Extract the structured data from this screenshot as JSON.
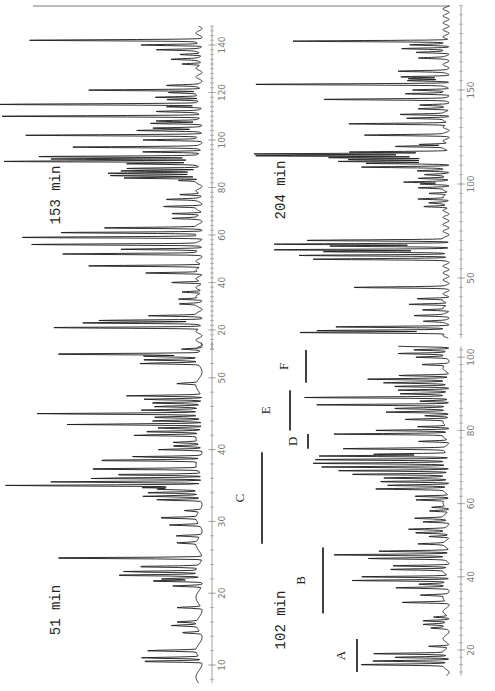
{
  "figure": {
    "orientation": "rotated-90-ccw",
    "top_rule": true
  },
  "chart_data": [
    {
      "type": "line",
      "title": "153 min",
      "xlabel": "",
      "ylabel": "",
      "xticks": [
        20,
        40,
        60,
        80,
        100,
        120,
        140
      ],
      "xlim": [
        12,
        148
      ],
      "layout": {
        "baseline_x": 203,
        "axis_x": 212,
        "label_x": 225,
        "y_at_min": 330,
        "min": 20,
        "px_per_unit": 2.375,
        "title_x": 60,
        "title_y": 195
      },
      "peaks": [
        [
          21,
          150
        ],
        [
          23,
          115
        ],
        [
          24,
          100
        ],
        [
          26,
          50
        ],
        [
          31,
          18
        ],
        [
          33,
          22
        ],
        [
          36,
          20
        ],
        [
          40,
          30
        ],
        [
          44,
          55
        ],
        [
          47,
          115
        ],
        [
          52,
          135
        ],
        [
          54,
          80
        ],
        [
          56,
          165
        ],
        [
          59,
          180
        ],
        [
          61,
          140
        ],
        [
          63,
          95
        ],
        [
          67,
          25
        ],
        [
          69,
          30
        ],
        [
          72,
          35
        ],
        [
          75,
          30
        ],
        [
          77,
          22
        ],
        [
          83,
          20
        ],
        [
          84,
          78
        ],
        [
          85,
          90
        ],
        [
          86,
          88
        ],
        [
          87,
          80
        ],
        [
          88,
          75
        ],
        [
          90,
          70
        ],
        [
          91,
          200
        ],
        [
          92,
          150
        ],
        [
          93,
          160
        ],
        [
          95,
          60
        ],
        [
          97,
          125
        ],
        [
          100,
          55
        ],
        [
          102,
          175
        ],
        [
          104,
          60
        ],
        [
          105,
          45
        ],
        [
          107,
          50
        ],
        [
          108,
          40
        ],
        [
          110,
          200
        ],
        [
          112,
          40
        ],
        [
          114,
          35
        ],
        [
          115,
          200
        ],
        [
          117,
          35
        ],
        [
          118,
          45
        ],
        [
          120,
          30
        ],
        [
          121,
          115
        ],
        [
          123,
          30
        ],
        [
          132,
          20
        ],
        [
          134,
          25
        ],
        [
          136,
          22
        ],
        [
          138,
          40
        ],
        [
          140,
          60
        ],
        [
          142,
          168
        ]
      ]
    },
    {
      "type": "line",
      "title": "204 min",
      "xticks": [
        50,
        100,
        150
      ],
      "xlim": [
        18,
        195
      ],
      "layout": {
        "baseline_x": 450,
        "axis_x": 461,
        "label_x": 474,
        "y_at_min": 278,
        "min": 50,
        "px_per_unit": 1.88,
        "title_x": 285,
        "title_y": 190
      },
      "peaks": [
        [
          21,
          150
        ],
        [
          22,
          130
        ],
        [
          24,
          110
        ],
        [
          27,
          20
        ],
        [
          30,
          30
        ],
        [
          33,
          25
        ],
        [
          36,
          40
        ],
        [
          39,
          30
        ],
        [
          45,
          90
        ],
        [
          60,
          130
        ],
        [
          62,
          150
        ],
        [
          64,
          120
        ],
        [
          65,
          175
        ],
        [
          67,
          115
        ],
        [
          68,
          170
        ],
        [
          70,
          140
        ],
        [
          88,
          25
        ],
        [
          90,
          15
        ],
        [
          92,
          30
        ],
        [
          95,
          20
        ],
        [
          98,
          28
        ],
        [
          100,
          25
        ],
        [
          101,
          40
        ],
        [
          103,
          30
        ],
        [
          105,
          20
        ],
        [
          107,
          30
        ],
        [
          109,
          85
        ],
        [
          111,
          80
        ],
        [
          112,
          105
        ],
        [
          113,
          100
        ],
        [
          114,
          120
        ],
        [
          115,
          190
        ],
        [
          116,
          190
        ],
        [
          117,
          100
        ],
        [
          120,
          50
        ],
        [
          121,
          30
        ],
        [
          126,
          80
        ],
        [
          132,
          100
        ],
        [
          135,
          40
        ],
        [
          137,
          45
        ],
        [
          140,
          30
        ],
        [
          142,
          25
        ],
        [
          145,
          120
        ],
        [
          148,
          40
        ],
        [
          150,
          35
        ],
        [
          153,
          190
        ],
        [
          155,
          40
        ],
        [
          156,
          35
        ],
        [
          157,
          45
        ],
        [
          160,
          45
        ],
        [
          167,
          25
        ],
        [
          170,
          30
        ],
        [
          172,
          45
        ],
        [
          174,
          35
        ],
        [
          176,
          155
        ]
      ]
    },
    {
      "type": "line",
      "title": "51 min",
      "xticks": [
        10,
        20,
        30,
        40,
        50
      ],
      "xlim": [
        7.5,
        55
      ],
      "layout": {
        "baseline_x": 203,
        "axis_x": 212,
        "label_x": 225,
        "y_at_min": 665,
        "min": 10,
        "px_per_unit": 7.18,
        "title_x": 60,
        "title_y": 610
      },
      "peaks": [
        [
          10.5,
          65
        ],
        [
          11,
          60
        ],
        [
          12,
          50
        ],
        [
          14.5,
          20
        ],
        [
          15.5,
          25
        ],
        [
          16,
          20
        ],
        [
          18,
          25
        ],
        [
          21,
          30
        ],
        [
          21.7,
          55
        ],
        [
          22,
          40
        ],
        [
          22.5,
          90
        ],
        [
          23,
          75
        ],
        [
          23.7,
          65
        ],
        [
          24.9,
          165
        ],
        [
          27,
          20
        ],
        [
          28,
          25
        ],
        [
          29.5,
          30
        ],
        [
          30.5,
          40
        ],
        [
          31.5,
          15
        ],
        [
          33,
          45
        ],
        [
          33.5,
          55
        ],
        [
          34,
          50
        ],
        [
          34.5,
          45
        ],
        [
          34.7,
          55
        ],
        [
          35,
          200
        ],
        [
          35.5,
          150
        ],
        [
          36,
          115
        ],
        [
          36.5,
          95
        ],
        [
          37.3,
          120
        ],
        [
          38.5,
          110
        ],
        [
          39,
          70
        ],
        [
          40,
          45
        ],
        [
          40.5,
          30
        ],
        [
          41,
          25
        ],
        [
          42,
          65
        ],
        [
          42.5,
          60
        ],
        [
          43,
          45
        ],
        [
          43.5,
          135
        ],
        [
          44,
          50
        ],
        [
          44.5,
          50
        ],
        [
          45,
          165
        ],
        [
          45.5,
          55
        ],
        [
          46,
          45
        ],
        [
          46.5,
          55
        ],
        [
          47,
          60
        ],
        [
          47.5,
          75
        ],
        [
          49.2,
          20
        ],
        [
          52,
          60
        ],
        [
          52.5,
          60
        ],
        [
          53,
          55
        ],
        [
          53.3,
          160
        ],
        [
          54,
          20
        ]
      ]
    },
    {
      "type": "line",
      "title": "102 min",
      "xticks": [
        20,
        40,
        60,
        80,
        100
      ],
      "xlim": [
        13,
        103
      ],
      "layout": {
        "baseline_x": 450,
        "axis_x": 461,
        "label_x": 474,
        "y_at_min": 650,
        "min": 20,
        "px_per_unit": 3.66,
        "title_x": 285,
        "title_y": 620
      },
      "peaks": [
        [
          16,
          85
        ],
        [
          17,
          75
        ],
        [
          18,
          55
        ],
        [
          19,
          70
        ],
        [
          21,
          20
        ],
        [
          26,
          15
        ],
        [
          27,
          20
        ],
        [
          28,
          25
        ],
        [
          29,
          15
        ],
        [
          33,
          45
        ],
        [
          35,
          25
        ],
        [
          37,
          50
        ],
        [
          38,
          25
        ],
        [
          39,
          95
        ],
        [
          40,
          90
        ],
        [
          42,
          55
        ],
        [
          43,
          55
        ],
        [
          45,
          75
        ],
        [
          46,
          115
        ],
        [
          47,
          70
        ],
        [
          49,
          25
        ],
        [
          51,
          20
        ],
        [
          52,
          30
        ],
        [
          53,
          35
        ],
        [
          55,
          25
        ],
        [
          56,
          30
        ],
        [
          58,
          20
        ],
        [
          59,
          15
        ],
        [
          61,
          30
        ],
        [
          62,
          35
        ],
        [
          64,
          70
        ],
        [
          65,
          60
        ],
        [
          66,
          70
        ],
        [
          67,
          60
        ],
        [
          68,
          95
        ],
        [
          69,
          110
        ],
        [
          70,
          130
        ],
        [
          71,
          130
        ],
        [
          72,
          135
        ],
        [
          73,
          130
        ],
        [
          73.5,
          75
        ],
        [
          75,
          100
        ],
        [
          77,
          30
        ],
        [
          79,
          110
        ],
        [
          80,
          75
        ],
        [
          81,
          30
        ],
        [
          83,
          40
        ],
        [
          84,
          25
        ],
        [
          85,
          60
        ],
        [
          86,
          50
        ],
        [
          87,
          130
        ],
        [
          88,
          30
        ],
        [
          89,
          140
        ],
        [
          90,
          45
        ],
        [
          91,
          50
        ],
        [
          92,
          55
        ],
        [
          93,
          60
        ],
        [
          94,
          80
        ],
        [
          95,
          50
        ],
        [
          98,
          25
        ],
        [
          100,
          30
        ],
        [
          101,
          45
        ],
        [
          102,
          35
        ],
        [
          103,
          50
        ],
        [
          104,
          130
        ],
        [
          105,
          20
        ]
      ],
      "regions": [
        {
          "label": "A",
          "from": 14,
          "to": 23,
          "x": 357,
          "label_x": 353
        },
        {
          "label": "B",
          "from": 30,
          "to": 48,
          "x": 323,
          "label_x": 313
        },
        {
          "label": "C",
          "from": 49,
          "to": 74,
          "x": 262,
          "label_x": 252
        },
        {
          "label": "D",
          "from": 75,
          "to": 79,
          "x": 308,
          "label_x": 305
        },
        {
          "label": "E",
          "from": 80,
          "to": 91,
          "x": 290,
          "label_x": 278
        },
        {
          "label": "F",
          "from": 93,
          "to": 102,
          "x": 306,
          "label_x": 296
        }
      ]
    }
  ]
}
